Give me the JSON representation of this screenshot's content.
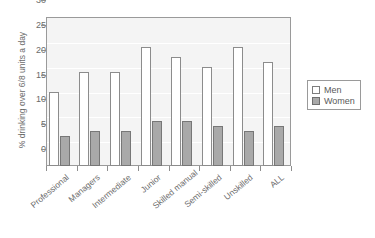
{
  "chart_data": {
    "type": "bar",
    "title": "",
    "xlabel": "",
    "ylabel": "% drinking over 6/8 units a day",
    "ylim": [
      0,
      30
    ],
    "yticks": [
      0,
      5,
      10,
      15,
      20,
      25,
      30
    ],
    "grid": true,
    "legend_position": "right",
    "categories": [
      "Professional",
      "Managers",
      "Intermediate",
      "Junior",
      "Skilled manual",
      "Semi-skilled",
      "Unskilled",
      "ALL"
    ],
    "series": [
      {
        "name": "Men",
        "color": "#ffffff",
        "values": [
          15,
          19,
          19,
          24,
          22,
          20,
          24,
          21
        ]
      },
      {
        "name": "Women",
        "color": "#a9a9a9",
        "values": [
          6,
          7,
          7,
          9,
          9,
          8,
          7,
          8
        ]
      }
    ]
  },
  "legend": {
    "items": [
      {
        "label": "Men"
      },
      {
        "label": "Women"
      }
    ]
  }
}
